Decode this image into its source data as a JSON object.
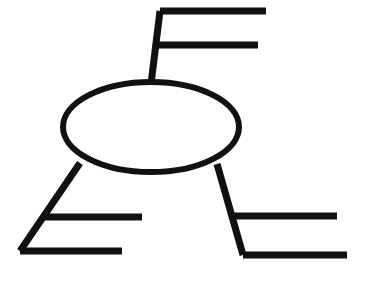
{
  "diagram": {
    "type": "line-drawing",
    "title": "",
    "background_color": "#ffffff",
    "stroke_color": "#111111",
    "canvas": {
      "width": 368,
      "height": 281
    },
    "central_node": {
      "shape": "ellipse",
      "label": "",
      "cx": 151,
      "cy": 127,
      "rx": 88,
      "ry": 45,
      "stroke_width": 6,
      "fill": "#ffffff"
    },
    "branches": [
      {
        "name": "top-branch",
        "label": "",
        "stroke_width": 7,
        "stem": {
          "x1": 151,
          "y1": 84,
          "x2": 160,
          "y2": 11
        },
        "connectors": [
          {
            "name": "top-branch-connector-1",
            "label": "",
            "x1": 160,
            "y1": 11,
            "x2": 266,
            "y2": 11
          },
          {
            "name": "top-branch-connector-2",
            "label": "",
            "x1": 157,
            "y1": 45,
            "x2": 258,
            "y2": 45
          }
        ]
      },
      {
        "name": "bottom-left-branch",
        "label": "",
        "stroke_width": 7,
        "stem": {
          "x1": 80,
          "y1": 163,
          "x2": 20,
          "y2": 251
        },
        "connectors": [
          {
            "name": "bottom-left-branch-connector-1",
            "label": "",
            "x1": 42,
            "y1": 217,
            "x2": 142,
            "y2": 217
          },
          {
            "name": "bottom-left-branch-connector-2",
            "label": "",
            "x1": 20,
            "y1": 251,
            "x2": 122,
            "y2": 251
          }
        ]
      },
      {
        "name": "bottom-right-branch",
        "label": "",
        "stroke_width": 7,
        "stem": {
          "x1": 217,
          "y1": 164,
          "x2": 243,
          "y2": 255
        },
        "connectors": [
          {
            "name": "bottom-right-branch-connector-1",
            "label": "",
            "x1": 231,
            "y1": 216,
            "x2": 337,
            "y2": 216
          },
          {
            "name": "bottom-right-branch-connector-2",
            "label": "",
            "x1": 243,
            "y1": 255,
            "x2": 347,
            "y2": 255
          }
        ]
      }
    ]
  }
}
